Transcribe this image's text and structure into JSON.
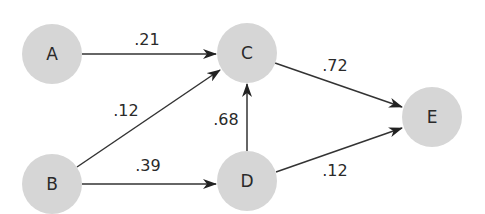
{
  "diagram": {
    "type": "directed-weighted-graph",
    "node_color": "#d6d6d6",
    "edge_color": "#333333",
    "nodes": [
      {
        "id": "A",
        "label": "A",
        "cx": 52,
        "cy": 54
      },
      {
        "id": "B",
        "label": "B",
        "cx": 52,
        "cy": 184
      },
      {
        "id": "C",
        "label": "C",
        "cx": 247,
        "cy": 53
      },
      {
        "id": "D",
        "label": "D",
        "cx": 247,
        "cy": 181
      },
      {
        "id": "E",
        "label": "E",
        "cx": 432,
        "cy": 117
      }
    ],
    "edges": [
      {
        "from": "A",
        "to": "C",
        "weight": ".21",
        "x1": 82,
        "y1": 54,
        "x2": 216,
        "y2": 54,
        "lx": 147,
        "ly": 45
      },
      {
        "from": "B",
        "to": "C",
        "weight": ".12",
        "x1": 77,
        "y1": 167,
        "x2": 220,
        "y2": 70,
        "lx": 126,
        "ly": 116
      },
      {
        "from": "B",
        "to": "D",
        "weight": ".39",
        "x1": 82,
        "y1": 184,
        "x2": 216,
        "y2": 184,
        "lx": 148,
        "ly": 171
      },
      {
        "from": "D",
        "to": "C",
        "weight": ".68",
        "x1": 247,
        "y1": 151,
        "x2": 247,
        "y2": 84,
        "lx": 226,
        "ly": 125
      },
      {
        "from": "C",
        "to": "E",
        "weight": ".72",
        "x1": 275,
        "y1": 63,
        "x2": 402,
        "y2": 107,
        "lx": 335,
        "ly": 71
      },
      {
        "from": "D",
        "to": "E",
        "weight": ".12",
        "x1": 276,
        "y1": 172,
        "x2": 402,
        "y2": 128,
        "lx": 335,
        "ly": 176
      }
    ]
  }
}
